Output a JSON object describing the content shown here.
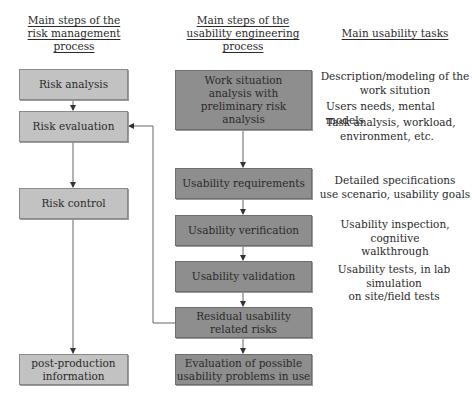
{
  "headers": {
    "risk": "Main steps of the risk management process",
    "risk_lines": [
      "Main steps of the",
      "risk management",
      "process"
    ],
    "usability_lines": [
      "Main steps of the",
      "usability engineering",
      "process"
    ],
    "tasks": "Main usability tasks"
  },
  "risk_steps": [
    {
      "label": "Risk analysis"
    },
    {
      "label": "Risk evaluation"
    },
    {
      "label": "Risk control"
    },
    {
      "lines": [
        "post-production",
        "information"
      ]
    }
  ],
  "usability_steps": [
    {
      "lines": [
        "Work situation",
        "analysis with",
        "preliminary risk",
        "analysis"
      ]
    },
    {
      "label": "Usability requirements"
    },
    {
      "label": "Usability verification"
    },
    {
      "label": "Usability validation"
    },
    {
      "lines": [
        "Residual usability",
        "related risks"
      ]
    },
    {
      "lines": [
        "Evaluation of possible",
        "usability problems in use"
      ]
    }
  ],
  "tasks": [
    {
      "lines": [
        "Description/modeling of the",
        "work sitution"
      ]
    },
    {
      "lines": [
        "Users needs, mental models"
      ]
    },
    {
      "lines": [
        "Task analysis, workload,",
        "environment, etc."
      ]
    },
    {
      "lines": [
        "Detailed specifications",
        "use scenario, usability goals"
      ]
    },
    {
      "lines": [
        "Usability inspection, cognitive",
        "walkthrough"
      ]
    },
    {
      "lines": [
        "Usability tests, in lab simulation",
        "on site/field tests"
      ]
    }
  ],
  "colors": {
    "risk_box": "#c2c2c2",
    "usability_box": "#8e8e8e",
    "line": "#555555"
  }
}
